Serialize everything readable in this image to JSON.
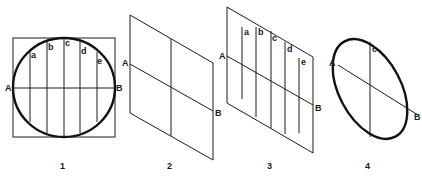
{
  "figures": [
    {
      "number": "1",
      "description": "circle inscribed in square with horizontal diameter AB and vertical chords a-e",
      "points": {
        "A": "A",
        "B": "B"
      },
      "chords": [
        "a",
        "b",
        "c",
        "d",
        "e"
      ]
    },
    {
      "number": "2",
      "description": "square projected as parallelogram with axis AB and vertical centerline",
      "points": {
        "A": "A",
        "B": "B"
      }
    },
    {
      "number": "3",
      "description": "parallelogram with projected chords a-e and axis AB",
      "points": {
        "A": "A",
        "B": "B"
      },
      "chords": [
        "a",
        "b",
        "c",
        "d",
        "e"
      ]
    },
    {
      "number": "4",
      "description": "resulting ellipse with axis AB and vertical line c",
      "points": {
        "A": "A",
        "B": "B",
        "C": "c"
      }
    }
  ],
  "colors": {
    "line": "#1c1c1c",
    "background": "#ffffff"
  }
}
